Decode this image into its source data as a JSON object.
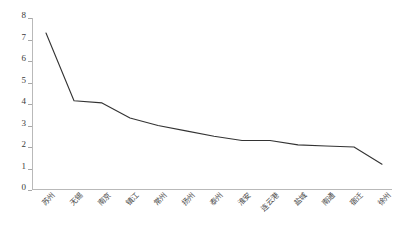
{
  "chart_data": {
    "type": "line",
    "title": "",
    "subtitle": "",
    "xlabel": "",
    "ylabel": "",
    "categories": [
      "苏州",
      "无锡",
      "南京",
      "镇江",
      "常州",
      "扬州",
      "泰州",
      "淮安",
      "连云港",
      "盐城",
      "南通",
      "宿迁",
      "徐州"
    ],
    "values": [
      7.3,
      4.15,
      4.05,
      3.35,
      3.0,
      2.75,
      2.5,
      2.3,
      2.3,
      2.1,
      2.05,
      2.0,
      1.2
    ],
    "series": [
      {
        "name": "",
        "values": [
          7.3,
          4.15,
          4.05,
          3.35,
          3.0,
          2.75,
          2.5,
          2.3,
          2.3,
          2.1,
          2.05,
          2.0,
          1.2
        ]
      }
    ],
    "ylim": [
      0,
      8
    ],
    "xlim": [
      0,
      12
    ],
    "ytick_labels": [
      "0",
      "1",
      "2",
      "3",
      "4",
      "5",
      "6",
      "7",
      "8"
    ],
    "ytick_values": [
      0,
      1,
      2,
      3,
      4,
      5,
      6,
      7,
      8
    ],
    "grid": false,
    "legend": false,
    "legend_position": "none",
    "annotations": [],
    "line_color": "#333333",
    "axis_color": "#b9b9b9",
    "background_color": "#ffffff"
  }
}
